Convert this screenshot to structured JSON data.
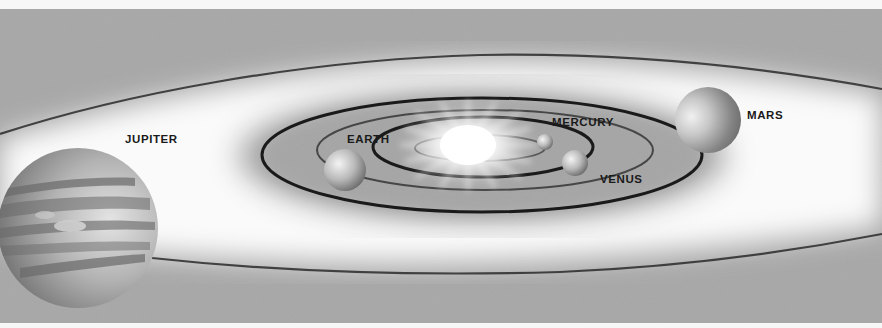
{
  "diagram": {
    "title": "",
    "type": "solar-system-orbits",
    "colors": {
      "background": "#a6a6a6",
      "border_strip": "#f7f7f7",
      "glow": "#ffffff",
      "orbit_line": "#1e1e1e",
      "label": "#1a1a1a"
    },
    "center_body": {
      "name": "sun",
      "label": ""
    },
    "planets": [
      {
        "name": "mercury",
        "label": "MERCURY"
      },
      {
        "name": "venus",
        "label": "VENUS"
      },
      {
        "name": "earth",
        "label": "EARTH"
      },
      {
        "name": "mars",
        "label": "MARS"
      },
      {
        "name": "jupiter",
        "label": "JUPITER"
      }
    ]
  }
}
